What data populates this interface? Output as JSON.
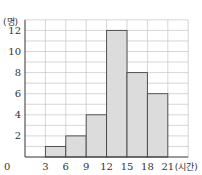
{
  "chart_data": {
    "type": "bar",
    "subtype": "histogram",
    "title": "",
    "xlabel": "(시간)",
    "ylabel": "(명)",
    "bins": [
      [
        3,
        6
      ],
      [
        6,
        9
      ],
      [
        9,
        12
      ],
      [
        12,
        15
      ],
      [
        15,
        18
      ],
      [
        18,
        21
      ]
    ],
    "categories": [
      "3~6",
      "6~9",
      "9~12",
      "12~15",
      "15~18",
      "18~21"
    ],
    "values": [
      1,
      2,
      4,
      12,
      8,
      6
    ],
    "x_ticks": [
      0,
      3,
      6,
      9,
      12,
      15,
      18,
      21
    ],
    "y_ticks": [
      0,
      2,
      4,
      6,
      8,
      10,
      12
    ],
    "xlim": [
      0,
      24
    ],
    "ylim": [
      0,
      13
    ],
    "grid": true,
    "legend": null,
    "colors": {
      "bar_fill": "#dcdcdc",
      "bar_edge": "#444444",
      "grid": "#bbbbbb",
      "axis": "#333333"
    }
  },
  "labels": {
    "origin": "0",
    "y_unit": "(명)",
    "x_unit": "(시간)",
    "x_tick_labels": [
      "3",
      "6",
      "9",
      "12",
      "15",
      "18",
      "21"
    ],
    "y_tick_labels": [
      "2",
      "4",
      "6",
      "8",
      "10",
      "12"
    ]
  }
}
